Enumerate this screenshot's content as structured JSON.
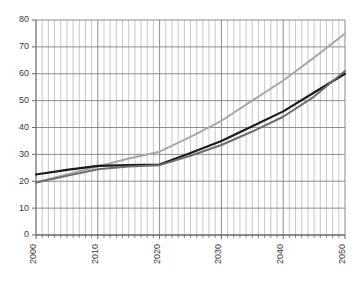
{
  "chart_data": {
    "type": "line",
    "title": "",
    "subtitle": "",
    "xlabel": "",
    "ylabel": "",
    "xlim": [
      2000,
      2050
    ],
    "ylim": [
      0,
      80
    ],
    "grid": true,
    "legend_position": "none",
    "x_tick_labels": [
      "2000",
      "2010",
      "2020",
      "2030",
      "2040",
      "2050"
    ],
    "x_tick_values": [
      2000,
      2010,
      2020,
      2030,
      2040,
      2050
    ],
    "y_tick_labels": [
      "0",
      "10",
      "20",
      "30",
      "40",
      "50",
      "60",
      "70",
      "80"
    ],
    "y_tick_values": [
      0,
      10,
      20,
      30,
      40,
      50,
      60,
      70,
      80
    ],
    "x_minor_tick_step": 1,
    "x": [
      2000,
      2005,
      2010,
      2015,
      2020,
      2025,
      2030,
      2035,
      2040,
      2045,
      2050
    ],
    "series": [
      {
        "name": "series-light-gray",
        "color": "#a8a8a8",
        "width": 2,
        "values": [
          19.5,
          22.5,
          25.5,
          28.5,
          31.0,
          36.5,
          42.5,
          50.0,
          57.5,
          66.0,
          75.0
        ]
      },
      {
        "name": "series-black",
        "color": "#1a1a1a",
        "width": 2.2,
        "values": [
          22.5,
          24.2,
          25.7,
          26.0,
          26.2,
          30.5,
          35.0,
          40.5,
          46.0,
          53.0,
          60.0
        ]
      },
      {
        "name": "series-medium-gray",
        "color": "#6e6e6e",
        "width": 2,
        "values": [
          19.5,
          22.0,
          24.5,
          25.5,
          26.0,
          29.5,
          33.5,
          38.5,
          44.0,
          51.5,
          61.0
        ]
      }
    ],
    "colors": {
      "gridline_major": "#808080",
      "gridline_minor": "#b0b0b0",
      "axis": "#555555",
      "tick_text": "#3a3a3a",
      "background": "#ffffff"
    }
  }
}
